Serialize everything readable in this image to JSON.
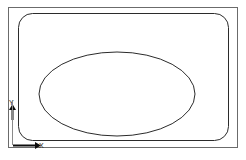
{
  "figure": {
    "background_color": "#ffffff",
    "line_color": "#2b2b2b",
    "axis_color": "#0d0d0d"
  },
  "shapes": {
    "outer_frame": {
      "name": "outer-frame-rectangle",
      "x": 8,
      "y": 7,
      "width": 229,
      "height": 140,
      "corner_radius": 0,
      "stroke": "#6b6b6b",
      "stroke_width": 1,
      "fill": "none"
    },
    "inner_rounded_rect": {
      "name": "inner-rounded-rectangle",
      "x": 18,
      "y": 13,
      "width": 210,
      "height": 127,
      "corner_radius": 14,
      "stroke": "#2b2b2b",
      "stroke_width": 1,
      "fill": "none"
    },
    "ellipse": {
      "name": "inscribed-ellipse",
      "cx": 117,
      "cy": 94,
      "rx": 78,
      "ry": 42,
      "stroke": "#2b2b2b",
      "stroke_width": 1,
      "fill": "none"
    }
  },
  "axes": {
    "origin": {
      "x": 13,
      "y": 145
    },
    "x_axis": {
      "label": "X",
      "label_x": 39,
      "label_y": 148,
      "line_from_x": 13,
      "line_to_x": 35,
      "line_y": 145,
      "arrow_direction": "right",
      "stroke_width": 2
    },
    "y_axis": {
      "label": "Y",
      "label_x": 9,
      "label_y": 105,
      "line_x": 12,
      "line_from_y": 120,
      "line_to_y": 110,
      "arrow_direction": "up",
      "stroke_width": 2
    }
  }
}
